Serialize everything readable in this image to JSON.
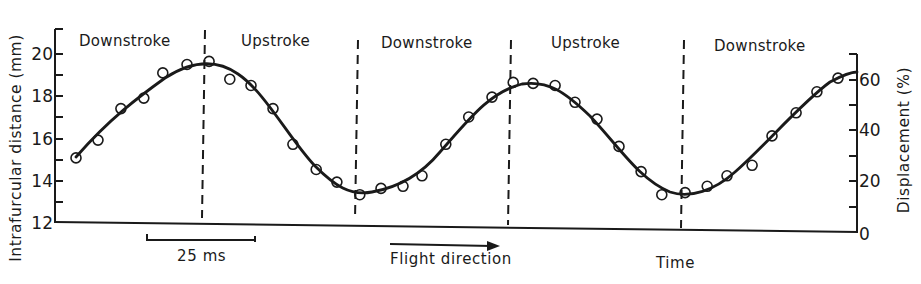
{
  "chart_data": {
    "type": "line",
    "title": "",
    "xlabel": "Time",
    "ylabel": "Intrafurcular distance (mm)",
    "ylabel_right": "Displacement (%)",
    "ylim": [
      12,
      21
    ],
    "ylim_right": [
      0,
      68
    ],
    "yticks_left": [
      12,
      14,
      16,
      18,
      20
    ],
    "yticks_right": [
      0,
      20,
      40,
      60
    ],
    "grid": false,
    "legend": null,
    "phases": [
      "Downstroke",
      "Upstroke",
      "Downstroke",
      "Upstroke",
      "Downstroke"
    ],
    "phase_boundaries_ms": [
      29.6,
      65.0,
      100.5,
      140.5
    ],
    "scale_bar": {
      "label": "25 ms",
      "length_ms": 25
    },
    "annotations": [
      "Flight direction",
      "25 ms"
    ],
    "series": [
      {
        "name": "Measured intrafurcular distance",
        "style": "open circles",
        "x_ms": [
          0,
          5.1,
          10.4,
          15.7,
          20.1,
          25.7,
          30.8,
          35.6,
          40.5,
          45.6,
          50.2,
          55.6,
          60.4,
          65.7,
          70.6,
          75.7,
          80.1,
          85.6,
          90.9,
          96.3,
          101.2,
          105.8,
          110.9,
          115.5,
          120.6,
          125.7,
          130.8,
          135.6,
          141.0,
          146.1,
          150.7,
          156.5,
          161.1,
          166.7,
          171.5,
          176.4
        ],
        "y_mm": [
          15.05,
          15.9,
          17.4,
          17.9,
          19.1,
          19.5,
          19.65,
          18.8,
          18.5,
          17.4,
          15.7,
          14.5,
          13.9,
          13.3,
          13.6,
          13.7,
          14.2,
          15.7,
          17.0,
          17.95,
          18.65,
          18.6,
          18.5,
          17.7,
          16.9,
          15.6,
          14.4,
          13.3,
          13.4,
          13.7,
          14.2,
          14.7,
          16.1,
          17.2,
          18.2,
          18.85
        ]
      },
      {
        "name": "Fitted curve",
        "style": "solid line",
        "x_ms": [
          0,
          10,
          20,
          28,
          35,
          45,
          55,
          62,
          68,
          80,
          90,
          100,
          106,
          115,
          125,
          135,
          140,
          148,
          160,
          170,
          180
        ],
        "y_mm": [
          15.1,
          17.3,
          18.95,
          19.45,
          19.4,
          17.6,
          14.8,
          13.7,
          13.45,
          14.3,
          16.6,
          18.2,
          18.5,
          18.0,
          16.0,
          13.9,
          13.4,
          13.8,
          16.1,
          18.0,
          19.2
        ]
      }
    ]
  },
  "labels": {
    "y_left_title": "Intrafurcular distance (mm)",
    "y_right_title": "Displacement (%)",
    "x_title": "Time",
    "scale_bar": "25 ms",
    "flight_direction": "Flight direction",
    "phases": [
      "Downstroke",
      "Upstroke",
      "Downstroke",
      "Upstroke",
      "Downstroke"
    ],
    "left_ticks": [
      "20",
      "18",
      "16",
      "14",
      "12"
    ],
    "right_ticks": [
      "60",
      "40",
      "20",
      "0"
    ]
  },
  "colors": {
    "ink": "#1a1a1a",
    "background": "#ffffff"
  }
}
